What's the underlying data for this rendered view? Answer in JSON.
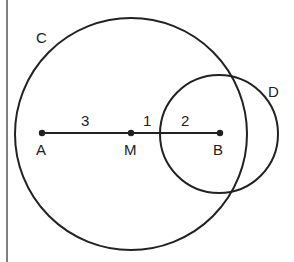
{
  "diagram": {
    "circles": [
      {
        "label": "C",
        "center": "M",
        "radius": 4
      },
      {
        "label": "D",
        "center": "B",
        "radius": 2
      }
    ],
    "points": [
      {
        "label": "A"
      },
      {
        "label": "M"
      },
      {
        "label": "B"
      }
    ],
    "segments": [
      {
        "from": "A",
        "to": "M",
        "length_label": "3"
      },
      {
        "from": "M",
        "to": "circle-D-edge",
        "length_label": "1"
      },
      {
        "from": "circle-D-edge",
        "to": "B",
        "length_label": "2"
      }
    ],
    "line_color": "#222222"
  }
}
